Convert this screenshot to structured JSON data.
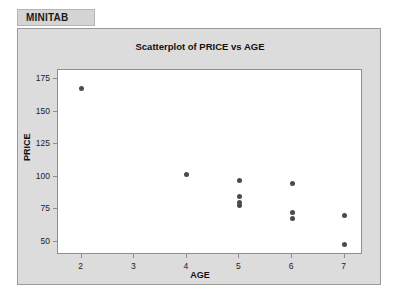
{
  "tab": {
    "label": "MINITAB"
  },
  "chart_data": {
    "type": "scatter",
    "title": "Scatterplot of PRICE vs AGE",
    "xlabel": "AGE",
    "ylabel": "PRICE",
    "xlim": [
      1.55,
      7.35
    ],
    "ylim": [
      40,
      182
    ],
    "xticks": [
      2,
      3,
      4,
      5,
      6,
      7
    ],
    "yticks": [
      50,
      75,
      100,
      125,
      150,
      175
    ],
    "grid": false,
    "legend": "none",
    "marker_color": "#4a4a4a",
    "points": [
      {
        "x": 2,
        "y": 168
      },
      {
        "x": 4,
        "y": 102
      },
      {
        "x": 5,
        "y": 97
      },
      {
        "x": 5,
        "y": 85
      },
      {
        "x": 5,
        "y": 80
      },
      {
        "x": 5,
        "y": 78
      },
      {
        "x": 6,
        "y": 95
      },
      {
        "x": 6,
        "y": 73
      },
      {
        "x": 6,
        "y": 68
      },
      {
        "x": 7,
        "y": 70
      },
      {
        "x": 7,
        "y": 48
      }
    ]
  }
}
